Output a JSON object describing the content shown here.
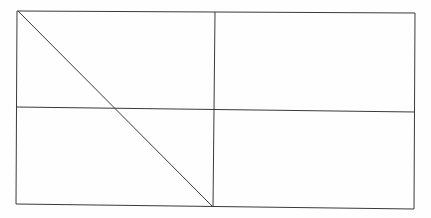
{
  "diagram": {
    "type": "geometric-figure",
    "stroke_color": "#3a3a3a",
    "background": "#fefefe",
    "outer_rectangle": {
      "points": [
        [
          17,
          11
        ],
        [
          415,
          13
        ],
        [
          414,
          209
        ],
        [
          16,
          204
        ]
      ]
    },
    "lines": [
      {
        "name": "horizontal-midline",
        "x1": 16,
        "y1": 107,
        "x2": 415,
        "y2": 112
      },
      {
        "name": "vertical-midline",
        "x1": 215,
        "y1": 12,
        "x2": 213,
        "y2": 207
      },
      {
        "name": "diagonal",
        "x1": 18,
        "y1": 11,
        "x2": 213,
        "y2": 207
      }
    ]
  }
}
